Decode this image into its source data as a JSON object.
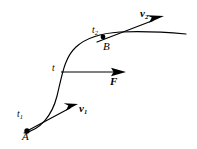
{
  "figure": {
    "kind": "physics-trajectory-diagram",
    "background_color": "#ffffff",
    "stroke_color": "#000000",
    "width": 197,
    "height": 149,
    "labels": {
      "point_a": "A",
      "point_b": "B",
      "time_start_base": "t",
      "time_start_sub": "1",
      "time_mid": "t",
      "time_end_base": "t",
      "time_end_sub": "2",
      "velocity_1_base": "v",
      "velocity_1_sub": "1",
      "velocity_2_base": "v",
      "velocity_2_sub": "2",
      "force": "F"
    },
    "curve": {
      "description": "S-shaped particle trajectory rising from A at lower-left to B at upper-right then flattening toward the right edge",
      "path": "M 24,133 C 40,130 52,116 57,96 C 62,76 64,58 76,47 C 88,36 104,33 120,32 C 142,31 164,32 186,34"
    },
    "markers": [
      {
        "name": "point-a-dot",
        "cx": 27,
        "cy": 131,
        "r": 2.6
      },
      {
        "name": "point-b-dot",
        "cx": 103,
        "cy": 37,
        "r": 2.4
      }
    ],
    "vectors": [
      {
        "name": "velocity-1",
        "label": "v1",
        "x1": 27,
        "y1": 131,
        "x2": 78,
        "y2": 104,
        "head_length": 13,
        "head_width": 6,
        "weight": "bold"
      },
      {
        "name": "force",
        "label": "F",
        "x1": 61,
        "y1": 72,
        "x2": 125,
        "y2": 72,
        "head_length": 12,
        "head_width": 6,
        "weight": "normal"
      },
      {
        "name": "velocity-2",
        "label": "v2",
        "x1": 97,
        "y1": 42,
        "x2": 164,
        "y2": 16,
        "head_length": 14,
        "head_width": 6,
        "weight": "bold"
      }
    ]
  }
}
